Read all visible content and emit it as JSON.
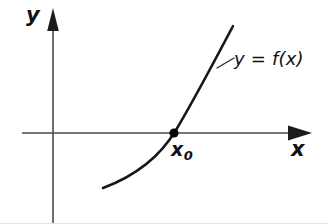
{
  "figure": {
    "kind": "math-function-graph",
    "caption_text": "",
    "axes": {
      "y_label": "y",
      "x_label": "x",
      "origin_px": {
        "x": 53,
        "y": 133
      },
      "x_axis_from_px": {
        "x": 22,
        "y": 133
      },
      "x_axis_to_px": {
        "x": 312,
        "y": 133
      },
      "y_axis_from_px": {
        "x": 53,
        "y": 224
      },
      "y_axis_to_px": {
        "x": 53,
        "y": 8
      },
      "x_arrow_tip_px": {
        "x": 312,
        "y": 133
      },
      "y_arrow_tip_px": {
        "x": 53,
        "y": 8
      },
      "axis_color": "#4a4a4a",
      "arrow_color": "#1c1c1c"
    },
    "curve": {
      "label": "y = f(x)",
      "color": "#171717",
      "stroke_width": 2.5,
      "shape": "increasing convex",
      "start_px": {
        "x": 103,
        "y": 188
      },
      "end_px": {
        "x": 233,
        "y": 26
      },
      "path_d": "M 103 188 C 130 178, 158 160, 176 130 C 194 100, 214 62, 233 26"
    },
    "root_point": {
      "label": "x",
      "label_subscript": "0",
      "label_full": "x0",
      "dot_px": {
        "x": 174,
        "y": 133
      },
      "dot_radius": 4.6,
      "dot_color": "#000000"
    },
    "leader": {
      "from_px": {
        "x": 217,
        "y": 68
      },
      "to_px": {
        "x": 234,
        "y": 58
      },
      "color": "#2a2a2a"
    },
    "background_color": "#ffffff",
    "scan_edge_color": "#e3e3e3"
  }
}
